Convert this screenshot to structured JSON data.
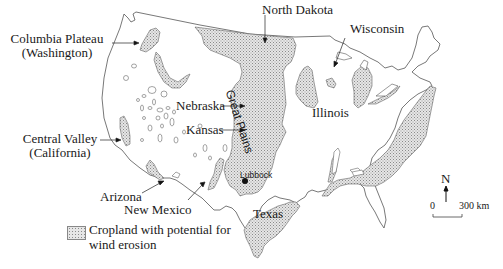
{
  "map": {
    "title": "Cropland with potential for wind erosion in the United States",
    "fill_color": "#d9d9d9",
    "outline_color": "#555555",
    "labels": {
      "columbia_plateau_line1": "Columbia Plateau",
      "columbia_plateau_line2": "(Washington)",
      "north_dakota": "North Dakota",
      "wisconsin": "Wisconsin",
      "great_plains": "Great Plains",
      "nebraska": "Nebraska",
      "kansas": "Kansas",
      "illinois": "Illinois",
      "central_valley_line1": "Central Valley",
      "central_valley_line2": "(California)",
      "lubbock": "Lubbock",
      "arizona": "Arizona",
      "new_mexico": "New Mexico",
      "texas": "Texas"
    },
    "legend": {
      "label_line1": "Cropland with potential for",
      "label_line2": "wind erosion"
    },
    "compass": {
      "label": "N"
    },
    "scale_bar": {
      "start": "0",
      "end": "300 km"
    }
  }
}
